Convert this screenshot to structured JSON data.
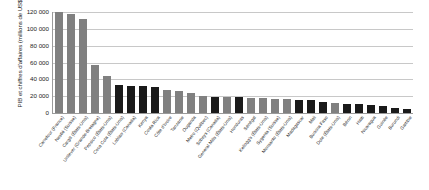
{
  "chart_data": {
    "type": "bar",
    "title": "",
    "xlabel": "",
    "ylabel": "PIB et chiffres d'affaires (millions de US$)",
    "ylim": [
      0,
      120000
    ],
    "ytick_labels": [
      "0",
      "20 000",
      "40 000",
      "60 000",
      "80 000",
      "100 000",
      "120 000"
    ],
    "ytick_values": [
      0,
      20000,
      40000,
      60000,
      80000,
      100000,
      120000
    ],
    "grid": true,
    "legend": "none",
    "colors": {
      "company": "#808080",
      "country": "#1a1a1a",
      "gridline": "#c8c8c8",
      "axis": "#9a9a9a",
      "background": "#ffffff"
    },
    "categories": [
      "Carrefour (France)",
      "Nestlé (Suisse)",
      "Cargill (États-Unis)",
      "Unilever (Grande-Bretagne)",
      "Pepsico (États-Unis)",
      "Coca Cola (États-Unis)",
      "Loblaw (Canada)",
      "Kenya",
      "Costa Rica",
      "Côte d'Ivoire",
      "Tanzanie",
      "Ouganda",
      "Metro (Québec)",
      "Sobeys (Canada)",
      "General Mills (États-Unis)",
      "Honduras",
      "Sénégal",
      "Kellogg's (États-Unis)",
      "Sygenta (Suisse)",
      "Monsanto (États-Unis)",
      "Madagascar",
      "Mali",
      "Burkina Faso",
      "Dole (États-Unis)",
      "Bénin",
      "Haïti",
      "Nicaragua",
      "Guinée",
      "Burundi",
      "Gambie"
    ],
    "values": [
      119500,
      118000,
      112000,
      56500,
      44500,
      33000,
      32000,
      32500,
      31000,
      27500,
      26500,
      23500,
      20000,
      19500,
      19000,
      18500,
      18000,
      17500,
      17000,
      16500,
      16000,
      15000,
      13000,
      12000,
      11000,
      10500,
      9500,
      8500,
      6500,
      5000
    ],
    "series_kind": [
      "company",
      "company",
      "company",
      "company",
      "company",
      "country",
      "country",
      "country",
      "country",
      "company",
      "company",
      "company",
      "company",
      "country",
      "company",
      "country",
      "company",
      "company",
      "company",
      "company",
      "country",
      "country",
      "country",
      "company",
      "country",
      "country",
      "country",
      "country",
      "country",
      "country"
    ]
  }
}
